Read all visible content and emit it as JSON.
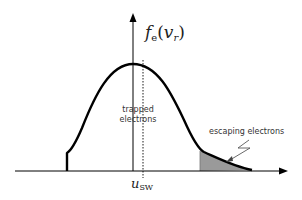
{
  "diagram": {
    "y_axis_label": {
      "f": "f",
      "sub": "e",
      "open": "(",
      "v": "v",
      "vsub": "r",
      "close": ")"
    },
    "x_marker_label": {
      "u": "u",
      "sub": "SW"
    },
    "annotations": {
      "trapped_line1": "trapped",
      "trapped_line2": "electrons",
      "escaping": "escaping electrons"
    },
    "colors": {
      "curve": "#000000",
      "shade": "#9a9a9a",
      "axis": "#000000"
    }
  }
}
